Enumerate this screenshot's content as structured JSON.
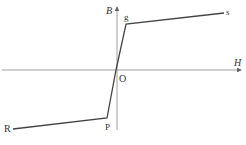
{
  "diagram": {
    "type": "B-H magnetization curve (piecewise linear)",
    "axes": {
      "x_label": "H",
      "y_label": "B",
      "origin_label": "O"
    },
    "points": [
      {
        "label": "R",
        "x": 13,
        "y": 129
      },
      {
        "label": "P",
        "x": 107,
        "y": 118
      },
      {
        "label": "O",
        "x": 116,
        "y": 70
      },
      {
        "label": "g",
        "x": 126,
        "y": 24
      },
      {
        "label": "s",
        "x": 224,
        "y": 13
      }
    ],
    "colors": {
      "curve": "#444444",
      "axes": "#888888",
      "labels": "#333333"
    }
  }
}
